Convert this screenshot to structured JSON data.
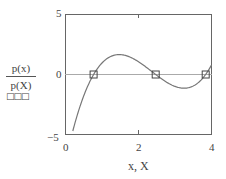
{
  "chart_data": {
    "type": "line",
    "title": "",
    "xlabel": "x, X",
    "ylabel": "p(x) / p(X)",
    "ylabel_numerator": "p(x)",
    "ylabel_denominator": "p(X)",
    "ylabel_marker_legend": "□□□",
    "xlim": [
      0,
      4
    ],
    "ylim": [
      -5,
      5
    ],
    "x_ticks": [
      "0",
      "2",
      "4"
    ],
    "y_ticks": [
      "5",
      "0",
      "−5"
    ],
    "grid": false,
    "zero_line": true,
    "series": [
      {
        "name": "p(x)",
        "style": "line",
        "color": "#666666",
        "x": [
          0.2,
          0.4,
          0.6,
          0.77,
          1.0,
          1.25,
          1.5,
          1.75,
          2.0,
          2.25,
          2.47,
          2.75,
          3.0,
          3.25,
          3.5,
          3.84,
          4.0
        ],
        "y": [
          -4.71,
          -2.59,
          -1.04,
          0.0,
          0.98,
          1.52,
          1.66,
          1.47,
          1.03,
          0.46,
          0.0,
          -0.51,
          -0.78,
          -0.82,
          -0.6,
          0.0,
          0.42
        ]
      },
      {
        "name": "p(X)",
        "style": "markers",
        "marker": "square",
        "color": "#444444",
        "x": [
          0.77,
          2.47,
          3.84
        ],
        "y": [
          0,
          0,
          0
        ]
      }
    ]
  }
}
